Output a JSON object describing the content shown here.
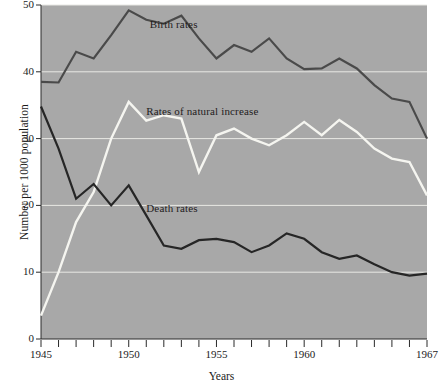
{
  "chart_data": {
    "type": "line",
    "title": "",
    "xlabel": "Years",
    "ylabel": "Number per 1000 population",
    "xlim": [
      1945,
      1967
    ],
    "ylim": [
      0,
      50
    ],
    "grid": true,
    "legend_position": "inline-annotations",
    "plot_background_color": "#a8a8a8",
    "x": [
      1945,
      1946,
      1947,
      1948,
      1949,
      1950,
      1951,
      1952,
      1953,
      1954,
      1955,
      1956,
      1957,
      1958,
      1959,
      1960,
      1961,
      1962,
      1963,
      1964,
      1965,
      1966,
      1967
    ],
    "xticks": [
      1945,
      1950,
      1955,
      1960,
      1967
    ],
    "xtick_labels": [
      "1945",
      "1950",
      "1955",
      "1960",
      "1967"
    ],
    "yticks": [
      0,
      10,
      20,
      30,
      40,
      50
    ],
    "ytick_labels": [
      "0",
      "10",
      "20",
      "30",
      "40",
      "50"
    ],
    "series": [
      {
        "name": "Birth rates",
        "color": "#4a4a4a",
        "label_x": 1951.2,
        "label_y": 47.0,
        "values": [
          38.5,
          38.4,
          43.0,
          42.0,
          45.5,
          49.2,
          47.8,
          47.2,
          48.4,
          45.0,
          42.0,
          44.0,
          43.0,
          45.0,
          42.0,
          40.4,
          40.5,
          42.0,
          40.5,
          38.0,
          36.0,
          35.5,
          30.0
        ]
      },
      {
        "name": "Rates of natural increase",
        "color": "#f5f5f0",
        "label_x": 1951.0,
        "label_y": 34.0,
        "values": [
          3.5,
          10.0,
          17.5,
          22.0,
          30.0,
          35.5,
          32.7,
          33.5,
          33.0,
          25.0,
          30.5,
          31.5,
          30.0,
          29.0,
          30.5,
          32.5,
          30.5,
          32.8,
          31.0,
          28.5,
          27.0,
          26.5,
          21.5
        ]
      },
      {
        "name": "Death rates",
        "color": "#262626",
        "label_x": 1951.0,
        "label_y": 19.4,
        "values": [
          34.8,
          28.5,
          21.0,
          23.2,
          20.0,
          23.0,
          18.5,
          14.0,
          13.5,
          14.8,
          15.0,
          14.5,
          13.0,
          14.0,
          15.8,
          15.0,
          13.0,
          12.0,
          12.5,
          11.2,
          10.0,
          9.5,
          9.8
        ]
      }
    ]
  }
}
